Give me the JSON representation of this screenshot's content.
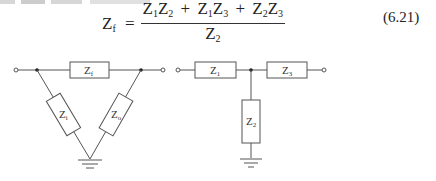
{
  "equation": {
    "lhs_symbol": "Z",
    "lhs_sub": "f",
    "equals": "=",
    "numerator": [
      {
        "a": "Z",
        "a_sub": "1",
        "b": "Z",
        "b_sub": "2"
      },
      {
        "op": "+"
      },
      {
        "a": "Z",
        "a_sub": "1",
        "b": "Z",
        "b_sub": "3"
      },
      {
        "op": "+"
      },
      {
        "a": "Z",
        "a_sub": "2",
        "b": "Z",
        "b_sub": "3"
      }
    ],
    "denominator": {
      "sym": "Z",
      "sub": "2"
    },
    "number": "(6.21)"
  },
  "pi_network": {
    "series_label": "Z",
    "series_sub": "f",
    "left_shunt_label": "Z",
    "left_shunt_sub": "i",
    "right_shunt_label": "Z",
    "right_shunt_sub": "o"
  },
  "t_network": {
    "left_label": "Z",
    "left_sub": "1",
    "right_label": "Z",
    "right_sub": "3",
    "shunt_label": "Z",
    "shunt_sub": "2"
  },
  "colors": {
    "line": "#555555",
    "text": "#222222",
    "background": "#ffffff"
  }
}
